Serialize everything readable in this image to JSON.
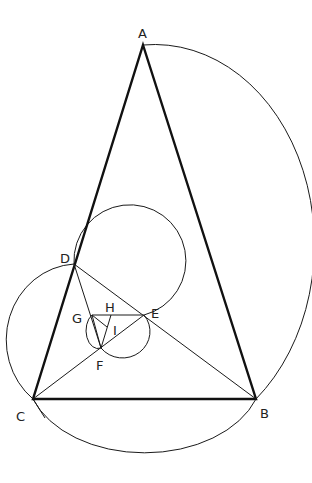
{
  "diagram": {
    "type": "geometric-construction",
    "points": {
      "A": {
        "label": "A",
        "x": 143,
        "y": 45
      },
      "B": {
        "label": "B",
        "x": 256,
        "y": 399
      },
      "C": {
        "label": "C",
        "x": 33,
        "y": 399
      },
      "D": {
        "label": "D",
        "x": 74,
        "y": 264
      },
      "E": {
        "label": "E",
        "x": 144,
        "y": 315
      },
      "F": {
        "label": "F",
        "x": 101,
        "y": 348
      },
      "G": {
        "label": "G",
        "x": 92,
        "y": 315
      },
      "H": {
        "label": "H",
        "x": 111,
        "y": 315
      },
      "I": {
        "label": "I",
        "x": 107,
        "y": 327
      }
    },
    "labels": {
      "A": "A",
      "B": "B",
      "C": "C",
      "D": "D",
      "E": "E",
      "F": "F",
      "G": "G",
      "H": "H",
      "I": "I"
    },
    "colors": {
      "stroke": "#1a1a1a",
      "background": "#ffffff"
    }
  }
}
